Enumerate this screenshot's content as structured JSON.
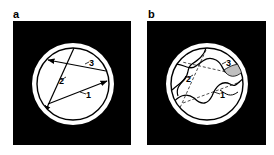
{
  "figure": {
    "panels": [
      {
        "id": "a",
        "label": "a",
        "description": "Straight paths through circular cross-section",
        "paths": [
          {
            "number": "1",
            "label": "1",
            "style": "solid-straight-arrow"
          },
          {
            "number": "2",
            "label": "2",
            "style": "solid-straight-arrow"
          },
          {
            "number": "3",
            "label": "3",
            "style": "solid-straight-arrow"
          }
        ]
      },
      {
        "id": "b",
        "label": "b",
        "description": "Tortuous paths through circular cross-section with straight reference lines dashed",
        "paths": [
          {
            "number": "1",
            "label": "1",
            "style": "wavy-solid"
          },
          {
            "number": "2",
            "label": "2",
            "style": "wavy-solid"
          },
          {
            "number": "3",
            "label": "3",
            "style": "wavy-solid"
          }
        ]
      }
    ],
    "colors": {
      "background": "#ffffff",
      "square": "#000000",
      "ring": "#ffffff",
      "inner": "#ffffff",
      "lines": "#000000"
    }
  }
}
